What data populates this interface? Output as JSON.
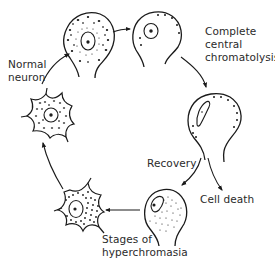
{
  "diagram": {
    "labels": {
      "normal_neuron": [
        "Normal",
        "neuron"
      ],
      "complete_central_chromatolysis": [
        "Complete",
        "central",
        "chromatolysis"
      ],
      "recovery": [
        "Recovery"
      ],
      "cell_death": [
        "Cell death"
      ],
      "stages_of_hyperchromasia": [
        "Stages of",
        "hyperchromasia"
      ]
    },
    "stages": [
      {
        "id": "stage-1",
        "description": "Normal neuron with dense Nissl granules and central nucleus"
      },
      {
        "id": "stage-2",
        "description": "Central chromatolysis, peripheral granules, eccentric nucleus"
      },
      {
        "id": "stage-3",
        "description": "Complete central chromatolysis, elongated eccentric nucleus"
      },
      {
        "id": "stage-4",
        "description": "Recovery, fine granules reappearing"
      },
      {
        "id": "stage-5",
        "description": "Hyperchromasia stage, stellate cell dense granules"
      },
      {
        "id": "stage-6",
        "description": "Hyperchromasia stage, stellate cell returning to normal"
      }
    ],
    "arrows": [
      {
        "from": "stage-6",
        "to": "stage-1"
      },
      {
        "from": "stage-1",
        "to": "stage-2"
      },
      {
        "from": "stage-2",
        "to": "stage-3"
      },
      {
        "from": "stage-3",
        "to": "stage-4",
        "label": "Recovery"
      },
      {
        "from": "stage-3",
        "to": "cell-death",
        "label": "Cell death"
      },
      {
        "from": "stage-4",
        "to": "stage-5"
      },
      {
        "from": "stage-5",
        "to": "stage-6"
      }
    ],
    "colors": {
      "ink": "#1a1a1a",
      "background": "#ffffff"
    }
  }
}
